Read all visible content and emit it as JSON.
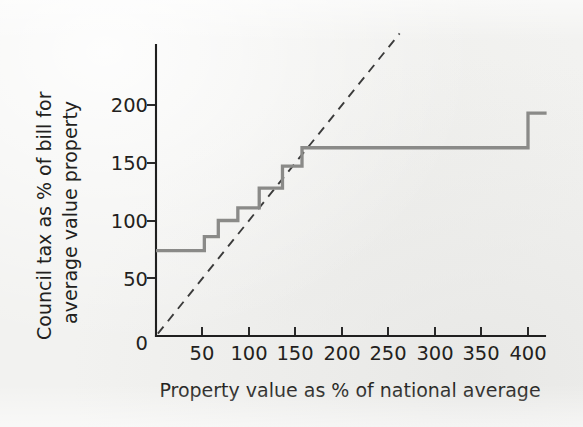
{
  "chart_data": {
    "type": "line",
    "title": "",
    "xlabel": "Property value as % of national average",
    "ylabel": "Council tax as % of bill for average value property",
    "ylabel_line1": "Council tax as % of bill for",
    "ylabel_line2": "average value property",
    "xlim": [
      0,
      420
    ],
    "ylim": [
      0,
      235
    ],
    "grid": false,
    "legend": null,
    "xticks": [
      50,
      100,
      150,
      200,
      250,
      300,
      350,
      400
    ],
    "xticklabels": [
      "50",
      "100",
      "150",
      "200",
      "250",
      "300",
      "350",
      "400"
    ],
    "yticks": [
      0,
      50,
      100,
      150,
      200
    ],
    "yticklabels": [
      "0",
      "50",
      "100",
      "150",
      "200"
    ],
    "series": [
      {
        "name": "Council tax step function",
        "style": "step-post",
        "color": "#8a8a88",
        "band_edges": [
          0,
          52,
          67,
          88,
          111,
          136,
          157,
          210,
          420
        ],
        "values": [
          74,
          86,
          100,
          111,
          128,
          147,
          163,
          193
        ],
        "points": [
          [
            0,
            74
          ],
          [
            52,
            74
          ],
          [
            52,
            86
          ],
          [
            67,
            86
          ],
          [
            67,
            100
          ],
          [
            88,
            100
          ],
          [
            88,
            111
          ],
          [
            111,
            111
          ],
          [
            111,
            128
          ],
          [
            136,
            128
          ],
          [
            136,
            147
          ],
          [
            157,
            147
          ],
          [
            157,
            163
          ],
          [
            210,
            163
          ],
          [
            210,
            163
          ],
          [
            400,
            163
          ],
          [
            400,
            193
          ],
          [
            420,
            193
          ]
        ]
      },
      {
        "name": "Proportional tax reference (45 degree)",
        "style": "dashed",
        "color": "#3b3b3b",
        "points": [
          [
            2,
            2
          ],
          [
            262,
            262
          ]
        ]
      }
    ]
  },
  "axes": {
    "x_axis_name": "x-axis",
    "y_axis_name": "y-axis"
  }
}
